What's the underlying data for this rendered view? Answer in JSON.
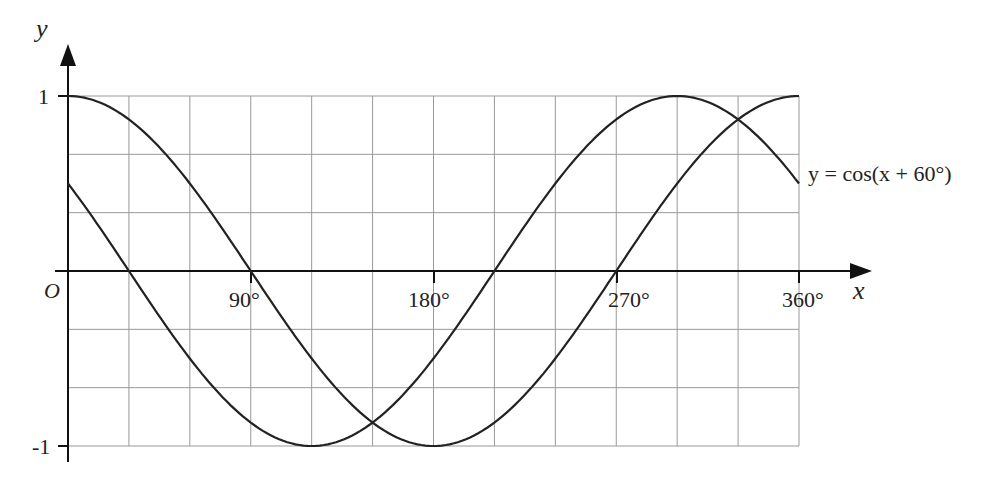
{
  "chart_data": {
    "type": "line",
    "title": "",
    "xlabel": "x",
    "ylabel": "y",
    "origin_label": "O",
    "x_tick_labels": [
      "90°",
      "180°",
      "270°",
      "360°"
    ],
    "x_ticks": [
      90,
      180,
      270,
      360
    ],
    "y_tick_labels": [
      "1",
      "-1"
    ],
    "y_ticks": [
      1,
      -1
    ],
    "xlim": [
      0,
      360
    ],
    "ylim": [
      -1,
      1
    ],
    "grid": {
      "x_step_deg": 30,
      "y_step": 0.3333
    },
    "series": [
      {
        "name": "y = cos x",
        "labeled": false,
        "x": [
          0,
          30,
          60,
          90,
          120,
          150,
          180,
          210,
          240,
          270,
          300,
          330,
          360
        ],
        "values": [
          1,
          0.866,
          0.5,
          0,
          -0.5,
          -0.866,
          -1,
          -0.866,
          -0.5,
          0,
          0.5,
          0.866,
          1
        ]
      },
      {
        "name": "y = cos(x + 60°)",
        "labeled": true,
        "x": [
          0,
          30,
          60,
          90,
          120,
          150,
          180,
          210,
          240,
          270,
          300,
          330,
          360
        ],
        "values": [
          0.5,
          0,
          -0.5,
          -0.866,
          -1,
          -0.866,
          -0.5,
          0,
          0.5,
          0.866,
          1,
          0.866,
          0.5
        ]
      }
    ],
    "annotations": [
      {
        "text": "y = cos(x + 60°)",
        "at_x": 360,
        "at_y": 0.5
      }
    ],
    "legend": null,
    "line_color": "#222222",
    "grid_color": "#999999"
  },
  "labels": {
    "y_axis": "y",
    "x_axis": "x",
    "origin": "O",
    "y_one": "1",
    "y_neg_one": "-1",
    "tick_90": "90°",
    "tick_180": "180°",
    "tick_270": "270°",
    "tick_360": "360°",
    "curve_label": "y = cos(x + 60°)"
  }
}
